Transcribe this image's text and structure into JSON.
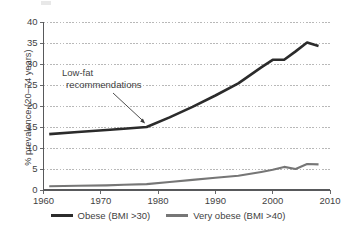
{
  "chart_data": {
    "type": "line",
    "title": "",
    "subtitle": "",
    "xlabel": "",
    "ylabel": "% prevalence (20–74 years)",
    "xlim": [
      1960,
      2010
    ],
    "ylim": [
      0,
      40
    ],
    "grid": "horizontal-dotted",
    "legend_position": "bottom-center",
    "x_ticks": [
      "1960",
      "1970",
      "1980",
      "1990",
      "2000",
      "2010"
    ],
    "y_ticks": [
      "0",
      "5",
      "10",
      "15",
      "20",
      "25",
      "30",
      "35",
      "40"
    ],
    "annotations": [
      {
        "text_line1": "Low-fat",
        "text_line2": "recommendations",
        "points_to_x": 1978,
        "points_to_y": 15
      }
    ],
    "series": [
      {
        "name": "Obese (BMI >30)",
        "color": "#2b2b2b",
        "x": [
          1961,
          1966,
          1971,
          1974,
          1978,
          1982,
          1986,
          1990,
          1994,
          1998,
          2000,
          2002,
          2004,
          2006,
          2008
        ],
        "values": [
          13.3,
          13.8,
          14.3,
          14.6,
          15.0,
          17.3,
          19.8,
          22.5,
          25.4,
          29.2,
          31.0,
          31.0,
          33.0,
          35.1,
          34.3
        ]
      },
      {
        "name": "Very obese (BMI >40)",
        "color": "#767676",
        "x": [
          1961,
          1966,
          1971,
          1974,
          1978,
          1982,
          1986,
          1990,
          1994,
          1998,
          2000,
          2002,
          2004,
          2006,
          2008
        ],
        "values": [
          0.9,
          1.0,
          1.1,
          1.25,
          1.4,
          1.9,
          2.4,
          2.9,
          3.4,
          4.3,
          4.8,
          5.5,
          5.0,
          6.2,
          6.1
        ]
      }
    ]
  },
  "axis": {
    "y_title": "% prevalence (20–74 years)",
    "y_ticks": [
      "40",
      "35",
      "30",
      "25",
      "20",
      "15",
      "10",
      "5",
      "0"
    ],
    "x_ticks": [
      "1960",
      "1970",
      "1980",
      "1990",
      "2000",
      "2010"
    ]
  },
  "annotation": {
    "line1": "Low-fat",
    "line2": "recommendations"
  },
  "legend": {
    "items": [
      {
        "label": "Obese (BMI >30)",
        "color": "#2b2b2b"
      },
      {
        "label": "Very obese (BMI >40)",
        "color": "#767676"
      }
    ]
  }
}
